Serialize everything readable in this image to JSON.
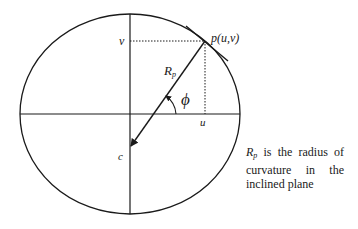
{
  "figure": {
    "labels": {
      "point": "p(u,v)",
      "v_axis": "v",
      "u_axis": "u",
      "radius_main": "R",
      "radius_sub": "p",
      "angle": "ϕ",
      "center": "c"
    },
    "caption": {
      "symbol_main": "R",
      "symbol_sub": "p",
      "text": " is the radius of curvature in the inclined plane"
    }
  }
}
